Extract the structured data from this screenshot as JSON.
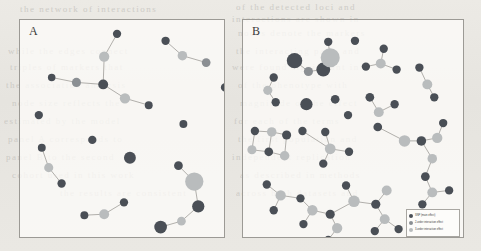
{
  "figure": {
    "background_color": "#e8e7e2",
    "panel_background": "#fcfbf9",
    "panel_border_color": "#9c9a95",
    "edge_color": "#b0aeaa"
  },
  "node_classes": {
    "snp": {
      "label": "SNP (main effect)",
      "color": "#4a4f56"
    },
    "order2": {
      "label": "2-order interaction effect",
      "color": "#8b8f93"
    },
    "order3": {
      "label": "3-order interaction effect",
      "color": "#b9bcbd"
    }
  },
  "legend": {
    "position": "bottom-right of panel B",
    "rows": [
      {
        "key": "snp",
        "label": "SNP (main effect)",
        "color": "#4a4f56"
      },
      {
        "key": "order2",
        "label": "2-order interaction effect",
        "color": "#8b8f93"
      },
      {
        "key": "order3",
        "label": "3-order interaction effect",
        "color": "#b9bcbd"
      }
    ]
  },
  "bleed_text": [
    {
      "x": 20,
      "y": 4,
      "text": "the  network  of  interactions"
    },
    {
      "x": 236,
      "y": 2,
      "text": "of  the  detected  loci  and"
    },
    {
      "x": 232,
      "y": 14,
      "text": "interactions  are  shown  in"
    },
    {
      "x": 238,
      "y": 28,
      "text": "nodes  denote  the  markers"
    },
    {
      "x": 8,
      "y": 46,
      "text": "while  the  edges  connect"
    },
    {
      "x": 236,
      "y": 46,
      "text": "the  interacting  pairs  and"
    },
    {
      "x": 10,
      "y": 62,
      "text": "triples  of  markers  that"
    },
    {
      "x": 232,
      "y": 62,
      "text": "were  found  significant  in"
    },
    {
      "x": 6,
      "y": 80,
      "text": "the  association  analysis"
    },
    {
      "x": 238,
      "y": 80,
      "text": "of  the  phenotype  with"
    },
    {
      "x": 12,
      "y": 98,
      "text": "node  size  reflects  the"
    },
    {
      "x": 240,
      "y": 98,
      "text": "magnitude  of  the  effect"
    },
    {
      "x": 4,
      "y": 116,
      "text": "estimated  by  the  model"
    },
    {
      "x": 234,
      "y": 116,
      "text": "for  each  of  the  terms"
    },
    {
      "x": 8,
      "y": 134,
      "text": "panel  A  corresponds  to"
    },
    {
      "x": 238,
      "y": 134,
      "text": "the  first  population  and"
    },
    {
      "x": 6,
      "y": 152,
      "text": "panel  B  to  the  second"
    },
    {
      "x": 232,
      "y": 152,
      "text": "independent  replication"
    },
    {
      "x": 12,
      "y": 170,
      "text": "cohort  used  in  this  work"
    },
    {
      "x": 240,
      "y": 170,
      "text": "as  described  in  methods"
    },
    {
      "x": 60,
      "y": 188,
      "text": "the  results  are  consistent"
    },
    {
      "x": 236,
      "y": 188,
      "text": "across  both  datasets  and"
    }
  ],
  "panels": [
    {
      "id": "panel-a",
      "label": "A",
      "viewbox": {
        "width": 206,
        "height": 219
      },
      "nodes": [
        {
          "id": "a1",
          "x": 98,
          "y": 14,
          "r": 4.2,
          "cls": "snp"
        },
        {
          "id": "a2",
          "x": 85,
          "y": 37,
          "r": 5.2,
          "cls": "order3"
        },
        {
          "id": "a3",
          "x": 84,
          "y": 65,
          "r": 5.0,
          "cls": "snp"
        },
        {
          "id": "a4",
          "x": 57,
          "y": 63,
          "r": 4.6,
          "cls": "order2"
        },
        {
          "id": "a5",
          "x": 32,
          "y": 58,
          "r": 3.8,
          "cls": "snp"
        },
        {
          "id": "a6",
          "x": 106,
          "y": 79,
          "r": 5.2,
          "cls": "order3"
        },
        {
          "id": "a7",
          "x": 130,
          "y": 86,
          "r": 4.0,
          "cls": "snp"
        },
        {
          "id": "a8",
          "x": 147,
          "y": 21,
          "r": 4.2,
          "cls": "snp"
        },
        {
          "id": "a9",
          "x": 164,
          "y": 36,
          "r": 4.8,
          "cls": "order3"
        },
        {
          "id": "a10",
          "x": 188,
          "y": 43,
          "r": 4.4,
          "cls": "order2"
        },
        {
          "id": "a11",
          "x": 19,
          "y": 96,
          "r": 4.2,
          "cls": "snp"
        },
        {
          "id": "a12",
          "x": 73,
          "y": 121,
          "r": 4.2,
          "cls": "snp"
        },
        {
          "id": "a13",
          "x": 165,
          "y": 105,
          "r": 4.0,
          "cls": "snp"
        },
        {
          "id": "a14",
          "x": 22,
          "y": 129,
          "r": 4.0,
          "cls": "snp"
        },
        {
          "id": "a15",
          "x": 29,
          "y": 149,
          "r": 4.6,
          "cls": "order3"
        },
        {
          "id": "a16",
          "x": 42,
          "y": 165,
          "r": 4.2,
          "cls": "snp"
        },
        {
          "id": "a17",
          "x": 111,
          "y": 139,
          "r": 6.0,
          "cls": "snp"
        },
        {
          "id": "a18",
          "x": 160,
          "y": 147,
          "r": 4.4,
          "cls": "snp"
        },
        {
          "id": "a19",
          "x": 176,
          "y": 163,
          "r": 9.2,
          "cls": "order3"
        },
        {
          "id": "a20",
          "x": 180,
          "y": 188,
          "r": 6.2,
          "cls": "snp"
        },
        {
          "id": "a21",
          "x": 163,
          "y": 203,
          "r": 4.4,
          "cls": "order3"
        },
        {
          "id": "a22",
          "x": 142,
          "y": 209,
          "r": 6.4,
          "cls": "snp"
        },
        {
          "id": "a23",
          "x": 105,
          "y": 184,
          "r": 4.2,
          "cls": "snp"
        },
        {
          "id": "a24",
          "x": 85,
          "y": 196,
          "r": 5.0,
          "cls": "order3"
        },
        {
          "id": "a25",
          "x": 65,
          "y": 197,
          "r": 4.0,
          "cls": "snp"
        },
        {
          "id": "a26",
          "x": 207,
          "y": 68,
          "r": 4.2,
          "cls": "snp"
        },
        {
          "id": "a27",
          "x": 216,
          "y": 88,
          "r": 4.8,
          "cls": "order3"
        },
        {
          "id": "a28",
          "x": 220,
          "y": 113,
          "r": 4.6,
          "cls": "snp"
        },
        {
          "id": "a29",
          "x": 219,
          "y": 134,
          "r": 4.8,
          "cls": "order3"
        },
        {
          "id": "a30",
          "x": 221,
          "y": 157,
          "r": 4.2,
          "cls": "snp"
        }
      ],
      "edges": [
        [
          "a1",
          "a2"
        ],
        [
          "a2",
          "a3"
        ],
        [
          "a3",
          "a4"
        ],
        [
          "a4",
          "a5"
        ],
        [
          "a3",
          "a6"
        ],
        [
          "a6",
          "a7"
        ],
        [
          "a8",
          "a9"
        ],
        [
          "a9",
          "a10"
        ],
        [
          "a14",
          "a15"
        ],
        [
          "a15",
          "a16"
        ],
        [
          "a18",
          "a19"
        ],
        [
          "a19",
          "a20"
        ],
        [
          "a20",
          "a21"
        ],
        [
          "a21",
          "a22"
        ],
        [
          "a23",
          "a24"
        ],
        [
          "a24",
          "a25"
        ],
        [
          "a26",
          "a27"
        ],
        [
          "a27",
          "a28"
        ],
        [
          "a28",
          "a29"
        ],
        [
          "a29",
          "a30"
        ]
      ]
    },
    {
      "id": "panel-b",
      "label": "B",
      "viewbox": {
        "width": 222,
        "height": 219
      },
      "nodes": [
        {
          "id": "b1",
          "x": 52,
          "y": 41,
          "r": 7.8,
          "cls": "snp"
        },
        {
          "id": "b2",
          "x": 66,
          "y": 52,
          "r": 4.6,
          "cls": "order2"
        },
        {
          "id": "b3",
          "x": 81,
          "y": 50,
          "r": 7.0,
          "cls": "snp"
        },
        {
          "id": "b4",
          "x": 88,
          "y": 38,
          "r": 9.6,
          "cls": "order3"
        },
        {
          "id": "b5",
          "x": 86,
          "y": 22,
          "r": 4.2,
          "cls": "snp"
        },
        {
          "id": "b6",
          "x": 113,
          "y": 21,
          "r": 4.2,
          "cls": "snp"
        },
        {
          "id": "b7",
          "x": 31,
          "y": 58,
          "r": 4.2,
          "cls": "snp"
        },
        {
          "id": "b8",
          "x": 25,
          "y": 71,
          "r": 4.6,
          "cls": "order3"
        },
        {
          "id": "b9",
          "x": 33,
          "y": 83,
          "r": 4.2,
          "cls": "snp"
        },
        {
          "id": "b10",
          "x": 64,
          "y": 85,
          "r": 6.2,
          "cls": "snp"
        },
        {
          "id": "b11",
          "x": 93,
          "y": 80,
          "r": 4.4,
          "cls": "snp"
        },
        {
          "id": "b12",
          "x": 124,
          "y": 47,
          "r": 4.2,
          "cls": "snp"
        },
        {
          "id": "b13",
          "x": 139,
          "y": 44,
          "r": 5.0,
          "cls": "order3"
        },
        {
          "id": "b14",
          "x": 142,
          "y": 29,
          "r": 4.2,
          "cls": "snp"
        },
        {
          "id": "b15",
          "x": 155,
          "y": 50,
          "r": 4.2,
          "cls": "snp"
        },
        {
          "id": "b16",
          "x": 178,
          "y": 48,
          "r": 4.2,
          "cls": "snp"
        },
        {
          "id": "b17",
          "x": 186,
          "y": 65,
          "r": 5.0,
          "cls": "order3"
        },
        {
          "id": "b18",
          "x": 193,
          "y": 78,
          "r": 4.2,
          "cls": "snp"
        },
        {
          "id": "b19",
          "x": 128,
          "y": 78,
          "r": 4.4,
          "cls": "snp"
        },
        {
          "id": "b20",
          "x": 137,
          "y": 93,
          "r": 5.0,
          "cls": "order3"
        },
        {
          "id": "b21",
          "x": 153,
          "y": 85,
          "r": 4.2,
          "cls": "snp"
        },
        {
          "id": "b22",
          "x": 12,
          "y": 112,
          "r": 4.2,
          "cls": "snp"
        },
        {
          "id": "b23",
          "x": 29,
          "y": 113,
          "r": 4.8,
          "cls": "order3"
        },
        {
          "id": "b24",
          "x": 44,
          "y": 116,
          "r": 4.6,
          "cls": "snp"
        },
        {
          "id": "b25",
          "x": 9,
          "y": 131,
          "r": 4.6,
          "cls": "order3"
        },
        {
          "id": "b26",
          "x": 26,
          "y": 133,
          "r": 4.4,
          "cls": "snp"
        },
        {
          "id": "b27",
          "x": 42,
          "y": 137,
          "r": 4.8,
          "cls": "order3"
        },
        {
          "id": "b28",
          "x": 83,
          "y": 113,
          "r": 4.2,
          "cls": "snp"
        },
        {
          "id": "b29",
          "x": 88,
          "y": 130,
          "r": 5.4,
          "cls": "order3"
        },
        {
          "id": "b30",
          "x": 107,
          "y": 133,
          "r": 4.2,
          "cls": "snp"
        },
        {
          "id": "b31",
          "x": 81,
          "y": 145,
          "r": 4.2,
          "cls": "snp"
        },
        {
          "id": "b32",
          "x": 136,
          "y": 108,
          "r": 4.4,
          "cls": "snp"
        },
        {
          "id": "b33",
          "x": 163,
          "y": 122,
          "r": 5.8,
          "cls": "order3"
        },
        {
          "id": "b34",
          "x": 180,
          "y": 122,
          "r": 4.8,
          "cls": "snp"
        },
        {
          "id": "b35",
          "x": 196,
          "y": 119,
          "r": 5.2,
          "cls": "order3"
        },
        {
          "id": "b36",
          "x": 202,
          "y": 104,
          "r": 4.2,
          "cls": "snp"
        },
        {
          "id": "b37",
          "x": 191,
          "y": 140,
          "r": 4.8,
          "cls": "order3"
        },
        {
          "id": "b38",
          "x": 184,
          "y": 158,
          "r": 4.4,
          "cls": "snp"
        },
        {
          "id": "b39",
          "x": 191,
          "y": 174,
          "r": 5.0,
          "cls": "order3"
        },
        {
          "id": "b40",
          "x": 208,
          "y": 172,
          "r": 4.2,
          "cls": "snp"
        },
        {
          "id": "b41",
          "x": 181,
          "y": 186,
          "r": 4.2,
          "cls": "snp"
        },
        {
          "id": "b42",
          "x": 24,
          "y": 166,
          "r": 4.2,
          "cls": "snp"
        },
        {
          "id": "b43",
          "x": 38,
          "y": 177,
          "r": 5.2,
          "cls": "order3"
        },
        {
          "id": "b44",
          "x": 31,
          "y": 192,
          "r": 4.2,
          "cls": "snp"
        },
        {
          "id": "b45",
          "x": 58,
          "y": 180,
          "r": 4.2,
          "cls": "snp"
        },
        {
          "id": "b46",
          "x": 70,
          "y": 192,
          "r": 5.2,
          "cls": "order3"
        },
        {
          "id": "b47",
          "x": 61,
          "y": 206,
          "r": 4.2,
          "cls": "snp"
        },
        {
          "id": "b48",
          "x": 88,
          "y": 196,
          "r": 4.6,
          "cls": "snp"
        },
        {
          "id": "b49",
          "x": 95,
          "y": 210,
          "r": 5.2,
          "cls": "order3"
        },
        {
          "id": "b50",
          "x": 86,
          "y": 222,
          "r": 4.2,
          "cls": "snp"
        },
        {
          "id": "b51",
          "x": 112,
          "y": 183,
          "r": 5.8,
          "cls": "order3"
        },
        {
          "id": "b52",
          "x": 104,
          "y": 167,
          "r": 4.2,
          "cls": "snp"
        },
        {
          "id": "b53",
          "x": 134,
          "y": 186,
          "r": 4.6,
          "cls": "snp"
        },
        {
          "id": "b54",
          "x": 145,
          "y": 172,
          "r": 5.0,
          "cls": "order3"
        },
        {
          "id": "b55",
          "x": 143,
          "y": 201,
          "r": 5.0,
          "cls": "order3"
        },
        {
          "id": "b56",
          "x": 133,
          "y": 213,
          "r": 4.2,
          "cls": "snp"
        },
        {
          "id": "b57",
          "x": 157,
          "y": 211,
          "r": 4.2,
          "cls": "snp"
        },
        {
          "id": "b58",
          "x": 60,
          "y": 112,
          "r": 4.2,
          "cls": "snp"
        },
        {
          "id": "b59",
          "x": 106,
          "y": 96,
          "r": 4.2,
          "cls": "snp"
        }
      ],
      "edges": [
        [
          "b1",
          "b2"
        ],
        [
          "b2",
          "b3"
        ],
        [
          "b3",
          "b4"
        ],
        [
          "b4",
          "b5"
        ],
        [
          "b7",
          "b8"
        ],
        [
          "b8",
          "b9"
        ],
        [
          "b12",
          "b13"
        ],
        [
          "b13",
          "b14"
        ],
        [
          "b13",
          "b15"
        ],
        [
          "b16",
          "b17"
        ],
        [
          "b17",
          "b18"
        ],
        [
          "b19",
          "b20"
        ],
        [
          "b20",
          "b21"
        ],
        [
          "b22",
          "b23"
        ],
        [
          "b23",
          "b24"
        ],
        [
          "b22",
          "b25"
        ],
        [
          "b25",
          "b26"
        ],
        [
          "b26",
          "b23"
        ],
        [
          "b26",
          "b27"
        ],
        [
          "b27",
          "b24"
        ],
        [
          "b28",
          "b29"
        ],
        [
          "b29",
          "b30"
        ],
        [
          "b29",
          "b31"
        ],
        [
          "b29",
          "b58"
        ],
        [
          "b32",
          "b33"
        ],
        [
          "b33",
          "b34"
        ],
        [
          "b34",
          "b35"
        ],
        [
          "b35",
          "b36"
        ],
        [
          "b34",
          "b37"
        ],
        [
          "b37",
          "b38"
        ],
        [
          "b38",
          "b39"
        ],
        [
          "b39",
          "b40"
        ],
        [
          "b39",
          "b41"
        ],
        [
          "b42",
          "b43"
        ],
        [
          "b43",
          "b44"
        ],
        [
          "b43",
          "b45"
        ],
        [
          "b45",
          "b46"
        ],
        [
          "b46",
          "b47"
        ],
        [
          "b46",
          "b48"
        ],
        [
          "b48",
          "b49"
        ],
        [
          "b49",
          "b50"
        ],
        [
          "b48",
          "b51"
        ],
        [
          "b51",
          "b52"
        ],
        [
          "b51",
          "b53"
        ],
        [
          "b53",
          "b54"
        ],
        [
          "b53",
          "b55"
        ],
        [
          "b55",
          "b56"
        ],
        [
          "b55",
          "b57"
        ]
      ]
    }
  ]
}
